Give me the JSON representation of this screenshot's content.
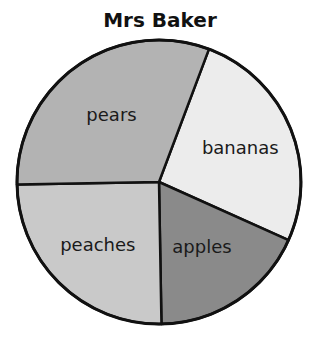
{
  "chart_data": {
    "type": "pie",
    "title": "Mrs Baker",
    "start": "top",
    "direction": "clockwise",
    "categories": [
      "bananas",
      "apples",
      "peaches",
      "pears"
    ],
    "values": [
      26,
      18,
      25,
      31
    ],
    "unit": "percent (estimated from slice angles)",
    "colors": [
      "#ececec",
      "#8a8a8a",
      "#c9c9c9",
      "#b3b3b3"
    ],
    "labels_on_slices": true,
    "legend": "none"
  }
}
